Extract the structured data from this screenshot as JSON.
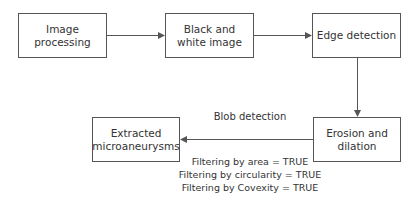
{
  "diagram": {
    "nodes": [
      {
        "id": "image-processing",
        "label": "Image processing"
      },
      {
        "id": "black-white",
        "label": "Black and white image"
      },
      {
        "id": "edge-detection",
        "label": "Edge detection"
      },
      {
        "id": "erosion-dilation",
        "label": "Erosion and dilation"
      },
      {
        "id": "extracted",
        "label": "Extracted microaneurysms"
      }
    ],
    "edges": [
      {
        "from": "image-processing",
        "to": "black-white"
      },
      {
        "from": "black-white",
        "to": "edge-detection"
      },
      {
        "from": "edge-detection",
        "to": "erosion-dilation"
      },
      {
        "from": "erosion-dilation",
        "to": "extracted",
        "label": "Blob detection"
      }
    ],
    "edge_label": "Blob detection",
    "filters": [
      "Filtering by area = TRUE",
      "Filtering by circularity = TRUE",
      "Filtering by Covexity = TRUE"
    ],
    "colors": {
      "stroke": "#555555",
      "text": "#333333"
    }
  }
}
